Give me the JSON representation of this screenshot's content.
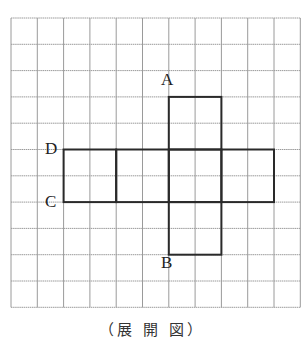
{
  "diagram": {
    "caption": "（展 開 図）",
    "grid": {
      "origin_x": 11,
      "origin_y": 18,
      "cell": 26.3,
      "cols": 11,
      "rows": 11,
      "line_color": "#9a9a9a"
    },
    "net": {
      "stroke_color": "#2a2a2a",
      "faces": [
        {
          "col": 6,
          "row": 3,
          "w": 2,
          "h": 2
        },
        {
          "col": 2,
          "row": 5,
          "w": 2,
          "h": 2
        },
        {
          "col": 4,
          "row": 5,
          "w": 2,
          "h": 2
        },
        {
          "col": 6,
          "row": 5,
          "w": 2,
          "h": 2
        },
        {
          "col": 8,
          "row": 5,
          "w": 2,
          "h": 2
        },
        {
          "col": 6,
          "row": 7,
          "w": 2,
          "h": 2
        }
      ]
    },
    "points": [
      {
        "name": "A",
        "x": 161,
        "y": 79
      },
      {
        "name": "D",
        "x": 45,
        "y": 148
      },
      {
        "name": "C",
        "x": 45,
        "y": 201
      },
      {
        "name": "B",
        "x": 161,
        "y": 262
      }
    ]
  }
}
